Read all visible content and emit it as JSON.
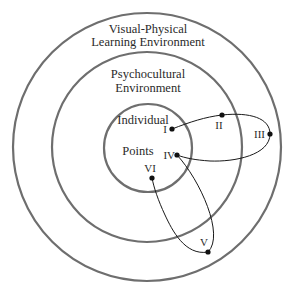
{
  "diagram": {
    "colors": {
      "ring": "#6e6e6e",
      "path": "#1a1a1a",
      "point": "#111111",
      "text": "#2a2a2a",
      "background": "#ffffff"
    },
    "rings": [
      {
        "id": "outer",
        "label_line1": "Visual-Physical",
        "label_line2": "Learning Environment",
        "cx": 147,
        "cy": 147,
        "r": 134
      },
      {
        "id": "middle",
        "label_line1": "Psychocultural",
        "label_line2": "Environment",
        "cx": 147,
        "cy": 147,
        "r": 95
      },
      {
        "id": "inner",
        "label_line1": "Individual",
        "label_line2": "Points",
        "cx": 148,
        "cy": 148,
        "r": 44
      }
    ],
    "points": [
      {
        "id": "I",
        "label": "I",
        "x": 172,
        "y": 129
      },
      {
        "id": "II",
        "label": "II",
        "x": 222,
        "y": 115
      },
      {
        "id": "III",
        "label": "III",
        "x": 270,
        "y": 134
      },
      {
        "id": "IV",
        "label": "IV",
        "x": 177,
        "y": 155
      },
      {
        "id": "V",
        "label": "V",
        "x": 208,
        "y": 252
      },
      {
        "id": "VI",
        "label": "VI",
        "x": 152,
        "y": 178
      }
    ],
    "path_order": [
      "I",
      "II",
      "III",
      "IV",
      "V",
      "VI"
    ]
  }
}
